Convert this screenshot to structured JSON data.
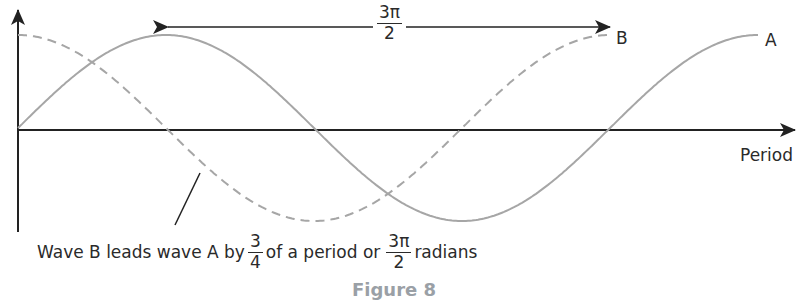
{
  "figure": {
    "title": "Figure 8",
    "top_label": {
      "numerator": "3π",
      "denominator": "2"
    },
    "wave_labels": {
      "a": "A",
      "b": "B"
    },
    "axis_label_x": "Period",
    "caption": {
      "part1": "Wave B leads wave A by",
      "frac1": {
        "numerator": "3",
        "denominator": "4"
      },
      "part2": "of a period or",
      "frac2": {
        "numerator": "3π",
        "denominator": "2"
      },
      "part3": "radians"
    },
    "colors": {
      "axis": "#222222",
      "wave": "#a6a6a6",
      "text": "#2a2a2a"
    }
  },
  "chart_data": {
    "type": "line",
    "title": "Figure 8",
    "xlabel": "Period",
    "ylabel": "",
    "series": [
      {
        "name": "A",
        "style": "solid",
        "function": "sin",
        "x": [
          0,
          0.25,
          0.5,
          0.75,
          1.0,
          1.25
        ],
        "values": [
          0,
          1,
          0,
          -1,
          0,
          1
        ]
      },
      {
        "name": "B",
        "style": "dashed",
        "function": "cos",
        "x": [
          0,
          0.25,
          0.5,
          0.75,
          1.0
        ],
        "values": [
          1,
          0,
          -1,
          0,
          1
        ]
      }
    ],
    "annotations": [
      "3π/2 (double arrow between peak of A and end of B)",
      "Wave B leads wave A by 3/4 of a period or 3π/2 radians"
    ],
    "grid": false
  }
}
